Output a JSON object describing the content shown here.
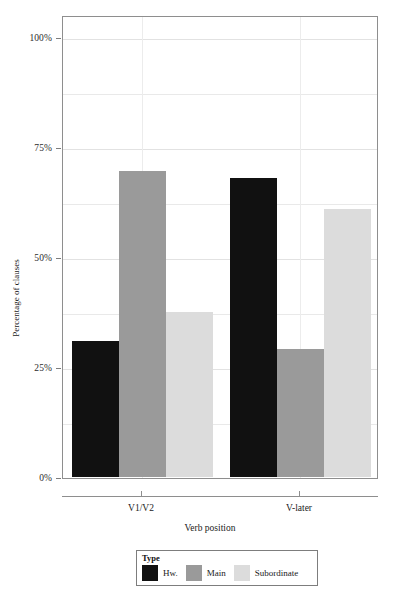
{
  "chart_data": {
    "type": "bar",
    "title": "",
    "subtitle": "",
    "xlabel": "Verb position",
    "ylabel": "Percentage of clauses",
    "categories": [
      "V1/V2",
      "V-later"
    ],
    "ylim": [
      0,
      100
    ],
    "yticks": [
      0,
      25,
      50,
      75,
      100
    ],
    "ytick_labels": [
      "0%",
      "25%",
      "50%",
      "75%",
      "100%"
    ],
    "grid": true,
    "legend_position": "bottom",
    "legend_title": "Type",
    "series": [
      {
        "name": "Hw.",
        "color": "#111111",
        "values": [
          31,
          68
        ]
      },
      {
        "name": "Main",
        "color": "#9a9a9a",
        "values": [
          69.5,
          29
        ]
      },
      {
        "name": "Subordinate",
        "color": "#dcdcdc",
        "values": [
          37.5,
          61
        ]
      }
    ]
  },
  "axis": {
    "y_title": "Percentage of clauses",
    "x_title": "Verb position"
  },
  "legend": {
    "title": "Type",
    "entries": [
      {
        "label": "Hw.",
        "color": "#111111"
      },
      {
        "label": "Main",
        "color": "#9a9a9a"
      },
      {
        "label": "Subordinate",
        "color": "#dcdcdc"
      }
    ]
  }
}
